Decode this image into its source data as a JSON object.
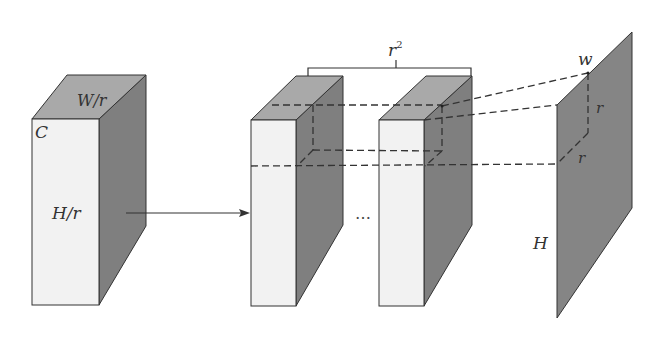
{
  "diagram": {
    "type": "sub-pixel convolution / pixel shuffle illustration",
    "colors": {
      "front_face": "#f2f2f2",
      "top_face": "#a9a9a9",
      "side_face": "#7f7f7f",
      "plane": "#858585",
      "stroke": "#333333",
      "background": "#ffffff"
    },
    "input_block": {
      "channel_label": "C",
      "width_label": "W/r",
      "height_label": "H/r"
    },
    "feature_maps": {
      "count_label": "r",
      "count_superscript": "2",
      "ellipsis": "…"
    },
    "output_plane": {
      "width_label": "w",
      "height_label": "H",
      "patch_height_label": "r",
      "patch_width_label": "r"
    }
  }
}
